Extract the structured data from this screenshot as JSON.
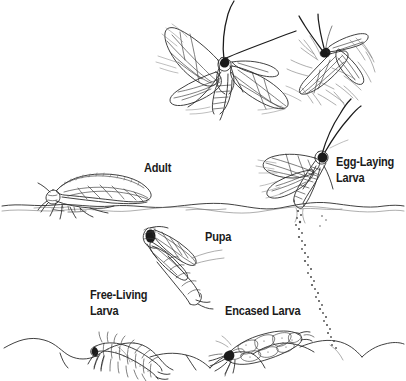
{
  "diagram": {
    "type": "scientific-illustration",
    "style": "pen-and-ink line drawing",
    "colors": {
      "background": "#ffffff",
      "ink": "#1b1b1b",
      "line": "#3a3a3a",
      "light_line": "#6e6e6e"
    },
    "labels": {
      "adult": "Adult",
      "egg_laying_larva_line1": "Egg-Laying",
      "egg_laying_larva_line2": "Larva",
      "pupa": "Pupa",
      "free_living_larva_line1": "Free-Living",
      "free_living_larva_line2": "Larva",
      "encased_larva": "Encased Larva"
    },
    "stages": [
      {
        "name": "flying-adult",
        "label": "",
        "position": "top-center"
      },
      {
        "name": "diving-adult",
        "label": "",
        "position": "top-right"
      },
      {
        "name": "resting-adult",
        "label": "Adult",
        "position": "left-waterline"
      },
      {
        "name": "egg-laying-adult",
        "label": "Egg-Laying Larva",
        "position": "right-waterline"
      },
      {
        "name": "pupa",
        "label": "Pupa",
        "position": "mid-water"
      },
      {
        "name": "free-living-larva",
        "label": "Free-Living Larva",
        "position": "streambed-left"
      },
      {
        "name": "encased-larva",
        "label": "Encased Larva",
        "position": "streambed-right"
      }
    ],
    "features": {
      "water_surface": "wavy double line",
      "stream_bed": "rounded pebbles and cobbles",
      "egg_trail": "dotted descending trail of eggs"
    }
  }
}
